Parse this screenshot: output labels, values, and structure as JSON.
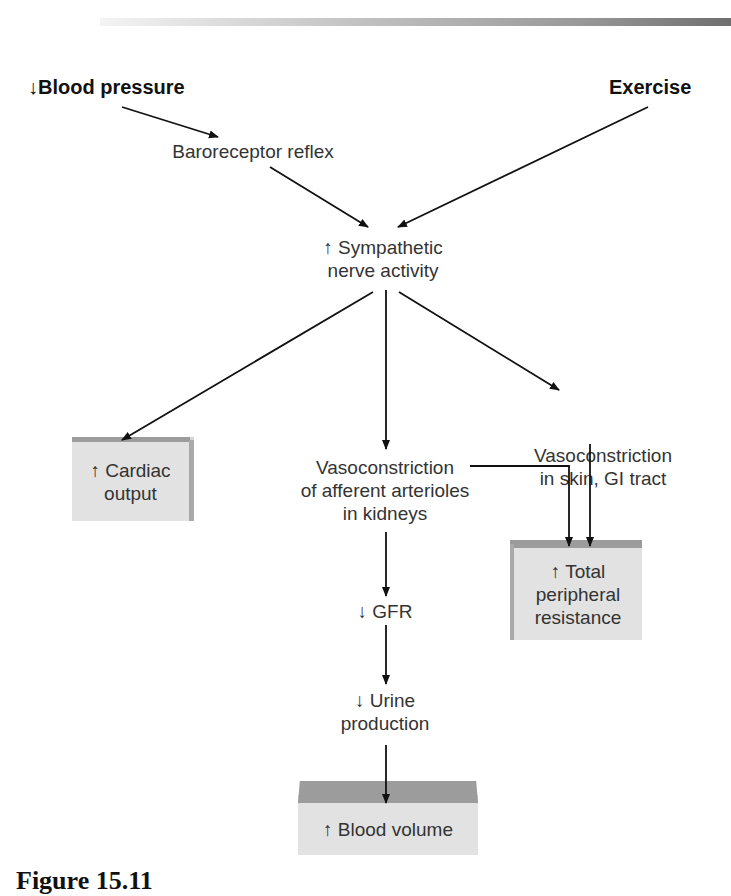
{
  "diagram": {
    "inputs": {
      "blood_pressure": "↓Blood pressure",
      "exercise": "Exercise"
    },
    "nodes": {
      "baroreceptor": "Baroreceptor reflex",
      "sympathetic_line1": "↑ Sympathetic",
      "sympathetic_line2": "nerve activity",
      "vaso_kidney_line1": "Vasoconstriction",
      "vaso_kidney_line2": "of afferent arterioles",
      "vaso_kidney_line3": "in kidneys",
      "vaso_skin_line1": "Vasoconstriction",
      "vaso_skin_line2": "in skin, GI tract",
      "gfr": "↓ GFR",
      "urine_line1": "↓ Urine",
      "urine_line2": "production"
    },
    "outcomes": {
      "cardiac_output_line1": "↑ Cardiac",
      "cardiac_output_line2": "output",
      "tpr_line1": "↑ Total",
      "tpr_line2": "peripheral",
      "tpr_line3": "resistance",
      "blood_volume": "↑ Blood volume"
    },
    "edges": [
      {
        "from": "Blood pressure",
        "to": "Baroreceptor reflex"
      },
      {
        "from": "Baroreceptor reflex",
        "to": "Sympathetic nerve activity"
      },
      {
        "from": "Exercise",
        "to": "Sympathetic nerve activity"
      },
      {
        "from": "Sympathetic nerve activity",
        "to": "Cardiac output"
      },
      {
        "from": "Sympathetic nerve activity",
        "to": "Vasoconstriction of afferent arterioles in kidneys"
      },
      {
        "from": "Sympathetic nerve activity",
        "to": "Vasoconstriction in skin, GI tract"
      },
      {
        "from": "Vasoconstriction of afferent arterioles in kidneys",
        "to": "Total peripheral resistance"
      },
      {
        "from": "Vasoconstriction in skin, GI tract",
        "to": "Total peripheral resistance"
      },
      {
        "from": "Vasoconstriction of afferent arterioles in kidneys",
        "to": "GFR"
      },
      {
        "from": "GFR",
        "to": "Urine production"
      },
      {
        "from": "Urine production",
        "to": "Blood volume"
      }
    ],
    "colors": {
      "box_face": "#e2e2e2",
      "box_top": "#9c9c9c",
      "arrow": "#111111"
    }
  },
  "caption": "Figure 15.11"
}
